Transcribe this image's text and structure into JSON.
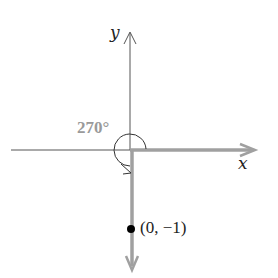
{
  "diagram": {
    "axes": {
      "x_label": "x",
      "y_label": "y"
    },
    "angle": {
      "label": "270°",
      "degrees": 270,
      "direction": "counterclockwise"
    },
    "point": {
      "label": "(0, −1)",
      "x": 0,
      "y": -1
    },
    "colors": {
      "axis": "#555555",
      "ray": "#a0a0a0",
      "angle_label": "#9a9a9a",
      "point": "#000000"
    }
  }
}
